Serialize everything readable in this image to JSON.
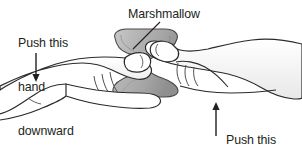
{
  "figure": {
    "background_color": "#ffffff",
    "ink_color": "#231f20",
    "marshmallow_fill": "#b3b3b3",
    "marshmallow_shadow": "#9a9a9a",
    "skin_fill": "#ffffff",
    "shade_fill": "#d9d9d9"
  },
  "labels": {
    "push_down": {
      "line1": "Push this",
      "line2": "hand",
      "line3": "downward"
    },
    "marshmallow": "Marshmallow",
    "push_up": {
      "line1": "Push this",
      "line2": "hand",
      "line3": "upward"
    }
  },
  "annotations": {
    "arrow_down_name": "downward-arrow",
    "arrow_up_name": "upward-arrow",
    "leader_line_name": "marshmallow-leader-line"
  }
}
